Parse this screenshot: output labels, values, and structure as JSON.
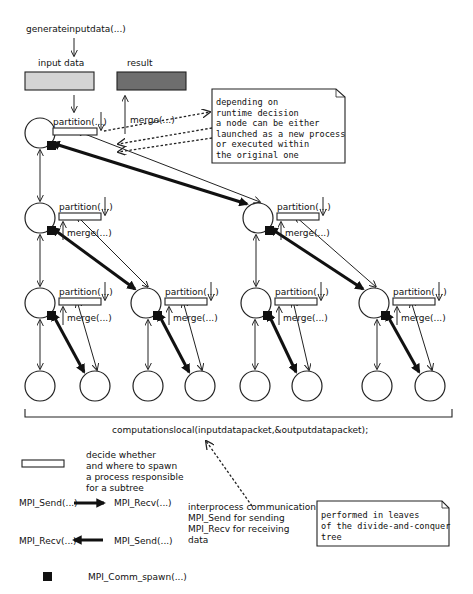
{
  "diagram": {
    "top_label": "generateinputdata(...)",
    "input_data_label": "input data",
    "result_label": "result",
    "input_data_color": "#d4d4d4",
    "result_color": "#6e6e6e",
    "partition_label": "partition(...)",
    "merge_label": "merge(...)",
    "note_runtime": [
      "depending on",
      "runtime decision",
      "a node can be either",
      "launched as a new process",
      "or executed within",
      "the original one"
    ],
    "leaf_computation_label": "computationslocal(inputdatapacket,&outputdatapacket);",
    "note_leaves": [
      "performed in leaves",
      "of the divide-and-conquer",
      "tree"
    ]
  },
  "legend": {
    "partition_box_desc": [
      "decide whether",
      "and where to spawn",
      "a process responsible",
      "for a subtree"
    ],
    "send_left": "MPI_Send(...)",
    "recv_right": "MPI_Recv(...)",
    "recv_left": "MPI_Recv(...)",
    "send_right": "MPI_Send(...)",
    "ipc_desc": [
      "interprocess communication",
      "MPI_Send for sending",
      "MPI_Recv for receiving",
      "data"
    ],
    "spawn_label": "MPI_Comm_spawn(...)"
  }
}
